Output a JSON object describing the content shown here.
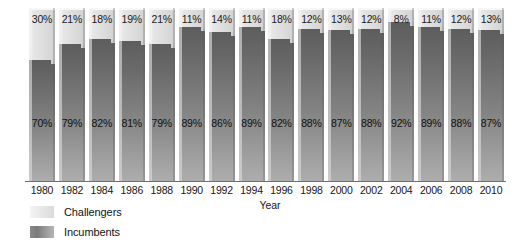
{
  "chart_data": {
    "type": "bar",
    "stacked": true,
    "title": "",
    "xlabel": "Year",
    "ylabel": "",
    "ylim": [
      0,
      100
    ],
    "grid": false,
    "legend_position": "bottom-left",
    "categories": [
      "1980",
      "1982",
      "1984",
      "1986",
      "1988",
      "1990",
      "1992",
      "1994",
      "1996",
      "1998",
      "2000",
      "2002",
      "2004",
      "2006",
      "2008",
      "2010"
    ],
    "series": [
      {
        "name": "Challengers",
        "color": "#e4e4e4",
        "values": [
          30,
          21,
          18,
          19,
          21,
          11,
          14,
          11,
          18,
          12,
          13,
          12,
          8,
          11,
          12,
          13
        ],
        "labels": [
          "30%",
          "21%",
          "18%",
          "19%",
          "21%",
          "11%",
          "14%",
          "11%",
          "18%",
          "12%",
          "13%",
          "12%",
          "8%",
          "11%",
          "12%",
          "13%"
        ]
      },
      {
        "name": "Incumbents",
        "color": "#7b7b7b",
        "values": [
          70,
          79,
          82,
          81,
          79,
          89,
          86,
          89,
          82,
          88,
          87,
          88,
          92,
          89,
          88,
          87
        ],
        "labels": [
          "70%",
          "79%",
          "82%",
          "81%",
          "79%",
          "89%",
          "86%",
          "89%",
          "82%",
          "88%",
          "87%",
          "88%",
          "92%",
          "89%",
          "88%",
          "87%"
        ]
      }
    ]
  },
  "axis": {
    "x_title": "Year",
    "tick_labels": [
      "1980",
      "1982",
      "1984",
      "1986",
      "1988",
      "1990",
      "1992",
      "1994",
      "1996",
      "1998",
      "2000",
      "2002",
      "2004",
      "2006",
      "2008",
      "2010"
    ]
  },
  "legend": {
    "items": [
      {
        "label": "Challengers",
        "swatch": "challengers-swatch"
      },
      {
        "label": "Incumbents",
        "swatch": "incumbents-swatch"
      }
    ]
  }
}
